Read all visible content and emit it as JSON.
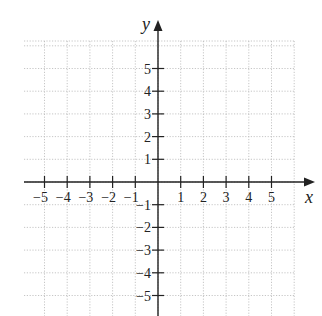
{
  "chart_data": {
    "type": "scatter",
    "title": "",
    "xlabel": "x",
    "ylabel": "y",
    "xlim": [
      -6,
      6
    ],
    "ylim": [
      -6,
      6
    ],
    "grid": true,
    "grid_style": "dotted",
    "x_ticks": [
      -5,
      -4,
      -3,
      -2,
      -1,
      1,
      2,
      3,
      4,
      5
    ],
    "y_ticks": [
      -5,
      -4,
      -3,
      -2,
      -1,
      1,
      2,
      3,
      4,
      5
    ],
    "x_tick_labels": [
      "−5",
      "−4",
      "−3",
      "−2",
      "−1",
      "1",
      "2",
      "3",
      "4",
      "5"
    ],
    "y_tick_labels": [
      "−5",
      "−4",
      "−3",
      "−2",
      "−1",
      "1",
      "2",
      "3",
      "4",
      "5"
    ],
    "series": [],
    "legend": null,
    "axis_arrows": [
      "x-positive",
      "y-positive"
    ]
  },
  "layout": {
    "origin_px": [
      158,
      182
    ],
    "unit_px": 22.7,
    "grid_left": 24,
    "grid_right": 295,
    "grid_top": 41,
    "grid_bottom": 316,
    "x_axis_end": 315,
    "y_axis_top": 20,
    "colors": {
      "axis": "#222222",
      "grid": "#b8b8b8",
      "background": "#ffffff"
    }
  }
}
